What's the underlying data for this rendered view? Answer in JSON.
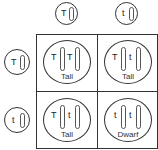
{
  "diagram": {
    "type": "punnett-square",
    "column_gametes": [
      {
        "allele": "T"
      },
      {
        "allele": "t"
      }
    ],
    "row_gametes": [
      {
        "allele": "T"
      },
      {
        "allele": "t"
      }
    ],
    "cells": [
      {
        "alleles": [
          "T",
          "T"
        ],
        "phenotype": "Tall"
      },
      {
        "alleles": [
          "T",
          "t"
        ],
        "phenotype": "Tall"
      },
      {
        "alleles": [
          "T",
          "t"
        ],
        "phenotype": "Tall"
      },
      {
        "alleles": [
          "t",
          "t"
        ],
        "phenotype": "Dwarf"
      }
    ]
  }
}
